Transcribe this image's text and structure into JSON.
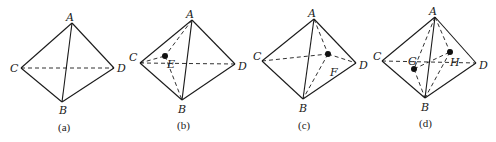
{
  "figure": {
    "panels": [
      {
        "caption": "(a)",
        "vertices": {
          "A": "A",
          "B": "B",
          "C": "C",
          "D": "D"
        },
        "points": []
      },
      {
        "caption": "(b)",
        "vertices": {
          "A": "A",
          "B": "B",
          "C": "C",
          "D": "D"
        },
        "points": [
          {
            "label": "E"
          }
        ]
      },
      {
        "caption": "(c)",
        "vertices": {
          "A": "A",
          "B": "B",
          "C": "C",
          "D": "D"
        },
        "points": [
          {
            "label": "F"
          }
        ]
      },
      {
        "caption": "(d)",
        "vertices": {
          "A": "A",
          "B": "B",
          "C": "C",
          "D": "D"
        },
        "points": [
          {
            "label": "G"
          },
          {
            "label": "H"
          }
        ]
      }
    ]
  }
}
